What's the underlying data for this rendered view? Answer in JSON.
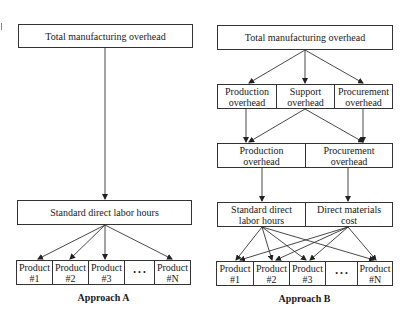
{
  "approach_a": {
    "top": "Total manufacturing overhead",
    "driver": "Standard direct labor hours",
    "products": [
      "Product\n#1",
      "Product\n#2",
      "Product\n#3",
      "• • •",
      "Product\n#N"
    ],
    "caption": "Approach A"
  },
  "approach_b": {
    "top": "Total manufacturing overhead",
    "pools": [
      "Production\noverhead",
      "Support\noverhead",
      "Procurement\noverhead"
    ],
    "combined": [
      "Production\noverhead",
      "Procurement\noverhead"
    ],
    "drivers": [
      "Standard direct\nlabor hours",
      "Direct materials\ncost"
    ],
    "products": [
      "Product\n#1",
      "Product\n#2",
      "Product\n#3",
      "• • •",
      "Product\n#N"
    ],
    "caption": "Approach B"
  }
}
